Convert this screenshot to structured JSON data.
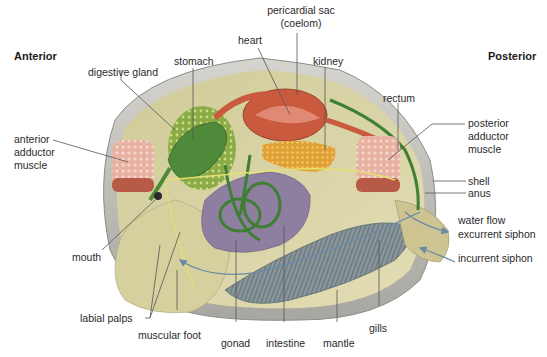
{
  "diagram": {
    "orientation": {
      "left": "Anterior",
      "right": "Posterior"
    },
    "labels": {
      "pericardial_sac_line1": "pericardial sac",
      "pericardial_sac_line2": "(coelom)",
      "heart": "heart",
      "stomach": "stomach",
      "kidney": "kidney",
      "digestive_gland": "digestive gland",
      "rectum": "rectum",
      "anterior_adductor_line1": "anterior",
      "anterior_adductor_line2": "adductor",
      "anterior_adductor_line3": "muscle",
      "posterior_adductor_line1": "posterior",
      "posterior_adductor_line2": "adductor",
      "posterior_adductor_line3": "muscle",
      "shell": "shell",
      "anus": "anus",
      "water_flow": "water flow",
      "excurrent_siphon": "excurrent siphon",
      "incurrent_siphon": "incurrent siphon",
      "mouth": "mouth",
      "labial_palps": "labial palps",
      "muscular_foot": "muscular foot",
      "gonad": "gonad",
      "intestine": "intestine",
      "mantle": "mantle",
      "gills": "gills"
    },
    "colors": {
      "shell": "#b9b7b3",
      "mantle_body": "#d8d3a6",
      "digestive_gland": "#8fb04a",
      "stomach": "#4f8a3a",
      "heart": "#c5533a",
      "kidney": "#e0a23a",
      "gonad": "#8e7ea0",
      "intestine": "#3f7f34",
      "gills": "#7f8c92",
      "adductor": "#e9b4a6",
      "leader_line": "#555555",
      "water_arrow": "#6a8aa8"
    }
  }
}
